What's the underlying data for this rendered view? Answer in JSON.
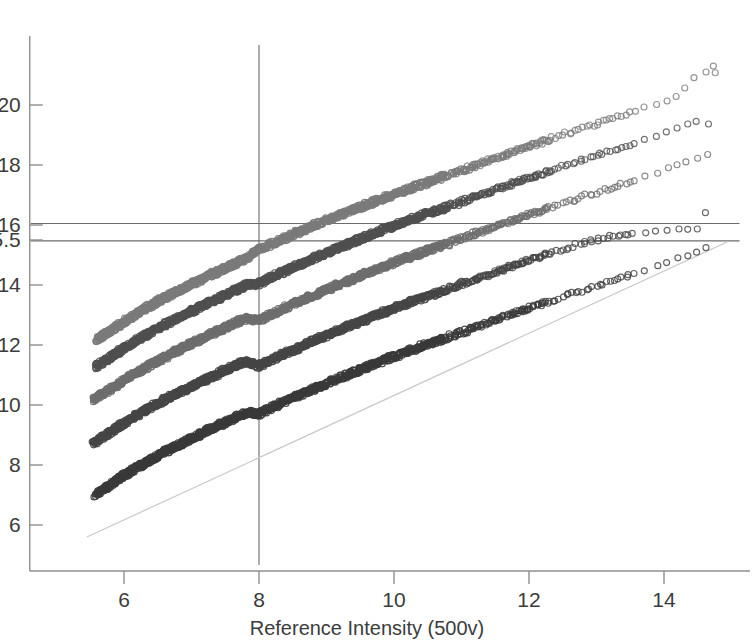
{
  "chart_data": {
    "type": "scatter",
    "title": "",
    "xlabel": "Reference Intensity (500v)",
    "ylabel": "",
    "xlim": [
      5.3,
      15.0
    ],
    "ylim": [
      5.4,
      21.6
    ],
    "xticks": [
      6,
      8,
      10,
      12,
      14
    ],
    "xtick_labels": [
      "6",
      "8",
      "10",
      "12",
      "14"
    ],
    "yticks": [
      6,
      8,
      10,
      12,
      14,
      15.5,
      16,
      18,
      20
    ],
    "ytick_labels": [
      "6",
      "8",
      "10",
      "12",
      "14",
      "15.5",
      "16",
      "18",
      "20"
    ],
    "grid": false,
    "legend": "none",
    "marker": "open-circle",
    "annotations": [
      {
        "name": "hline-16",
        "type": "hline",
        "y": 16.05,
        "color": "#6a6a6a"
      },
      {
        "name": "hline-15_5",
        "type": "hline",
        "y": 15.47,
        "color": "#6a6a6a"
      },
      {
        "name": "vline-8",
        "type": "vline",
        "x": 8.0,
        "color": "#6a6a6a"
      },
      {
        "name": "identity-line",
        "type": "line",
        "x0": 5.45,
        "y0": 5.6,
        "x1": 14.95,
        "y1": 15.45,
        "color": "#c9c9c9"
      }
    ],
    "series": [
      {
        "name": "band-1",
        "color": "#7b7b7b",
        "points": [
          [
            5.6,
            12.18
          ],
          [
            5.75,
            12.4
          ],
          [
            5.9,
            12.62
          ],
          [
            6.05,
            12.85
          ],
          [
            6.2,
            13.06
          ],
          [
            6.35,
            13.26
          ],
          [
            6.5,
            13.45
          ],
          [
            6.65,
            13.63
          ],
          [
            6.8,
            13.8
          ],
          [
            6.95,
            13.97
          ],
          [
            7.1,
            14.14
          ],
          [
            7.25,
            14.3
          ],
          [
            7.4,
            14.46
          ],
          [
            7.55,
            14.62
          ],
          [
            7.7,
            14.78
          ],
          [
            7.85,
            14.95
          ],
          [
            8.0,
            15.18
          ],
          [
            8.2,
            15.38
          ],
          [
            8.4,
            15.58
          ],
          [
            8.6,
            15.78
          ],
          [
            8.8,
            15.97
          ],
          [
            9.0,
            16.15
          ],
          [
            9.2,
            16.33
          ],
          [
            9.4,
            16.51
          ],
          [
            9.6,
            16.68
          ],
          [
            9.8,
            16.85
          ],
          [
            10.0,
            17.02
          ],
          [
            10.25,
            17.22
          ],
          [
            10.5,
            17.42
          ],
          [
            10.75,
            17.62
          ],
          [
            11.0,
            17.82
          ],
          [
            11.25,
            18.02
          ],
          [
            11.5,
            18.22
          ],
          [
            11.75,
            18.42
          ],
          [
            12.0,
            18.62
          ],
          [
            12.3,
            18.85
          ],
          [
            12.6,
            19.08
          ],
          [
            12.9,
            19.3
          ],
          [
            13.2,
            19.52
          ],
          [
            13.55,
            19.78
          ],
          [
            13.9,
            20.05
          ],
          [
            14.2,
            20.28
          ],
          [
            14.45,
            20.9
          ],
          [
            14.75,
            21.3
          ],
          [
            14.8,
            20.8
          ]
        ]
      },
      {
        "name": "band-2",
        "color": "#4f4f4f",
        "points": [
          [
            5.58,
            11.28
          ],
          [
            5.73,
            11.5
          ],
          [
            5.88,
            11.72
          ],
          [
            6.03,
            11.94
          ],
          [
            6.18,
            12.14
          ],
          [
            6.33,
            12.34
          ],
          [
            6.48,
            12.53
          ],
          [
            6.63,
            12.71
          ],
          [
            6.78,
            12.88
          ],
          [
            6.93,
            13.05
          ],
          [
            7.08,
            13.22
          ],
          [
            7.23,
            13.38
          ],
          [
            7.38,
            13.54
          ],
          [
            7.53,
            13.7
          ],
          [
            7.68,
            13.86
          ],
          [
            7.83,
            14.0
          ],
          [
            8.0,
            14.05
          ],
          [
            8.2,
            14.27
          ],
          [
            8.4,
            14.48
          ],
          [
            8.6,
            14.68
          ],
          [
            8.8,
            14.88
          ],
          [
            9.0,
            15.07
          ],
          [
            9.2,
            15.26
          ],
          [
            9.4,
            15.44
          ],
          [
            9.6,
            15.62
          ],
          [
            9.8,
            15.8
          ],
          [
            10.0,
            15.97
          ],
          [
            10.25,
            16.18
          ],
          [
            10.5,
            16.38
          ],
          [
            10.75,
            16.58
          ],
          [
            11.0,
            16.78
          ],
          [
            11.25,
            16.98
          ],
          [
            11.5,
            17.18
          ],
          [
            11.75,
            17.38
          ],
          [
            12.0,
            17.58
          ],
          [
            12.3,
            17.8
          ],
          [
            12.6,
            18.02
          ],
          [
            12.9,
            18.24
          ],
          [
            13.2,
            18.46
          ],
          [
            13.55,
            18.72
          ],
          [
            13.9,
            18.98
          ],
          [
            14.2,
            19.22
          ],
          [
            14.5,
            19.45
          ],
          [
            14.78,
            19.3
          ]
        ]
      },
      {
        "name": "band-3",
        "color": "#6e6e6e",
        "points": [
          [
            5.55,
            10.15
          ],
          [
            5.7,
            10.38
          ],
          [
            5.85,
            10.6
          ],
          [
            6.0,
            10.82
          ],
          [
            6.15,
            11.02
          ],
          [
            6.3,
            11.22
          ],
          [
            6.45,
            11.41
          ],
          [
            6.6,
            11.59
          ],
          [
            6.75,
            11.76
          ],
          [
            6.9,
            11.93
          ],
          [
            7.05,
            12.1
          ],
          [
            7.2,
            12.26
          ],
          [
            7.35,
            12.42
          ],
          [
            7.5,
            12.58
          ],
          [
            7.65,
            12.74
          ],
          [
            7.8,
            12.88
          ],
          [
            8.0,
            12.82
          ],
          [
            8.2,
            13.04
          ],
          [
            8.4,
            13.25
          ],
          [
            8.6,
            13.45
          ],
          [
            8.8,
            13.65
          ],
          [
            9.0,
            13.84
          ],
          [
            9.2,
            14.03
          ],
          [
            9.4,
            14.21
          ],
          [
            9.6,
            14.39
          ],
          [
            9.8,
            14.57
          ],
          [
            10.0,
            14.74
          ],
          [
            10.25,
            14.95
          ],
          [
            10.5,
            15.15
          ],
          [
            10.75,
            15.35
          ],
          [
            11.0,
            15.55
          ],
          [
            11.25,
            15.75
          ],
          [
            11.5,
            15.95
          ],
          [
            11.75,
            16.15
          ],
          [
            12.0,
            16.35
          ],
          [
            12.3,
            16.57
          ],
          [
            12.6,
            16.79
          ],
          [
            12.9,
            17.01
          ],
          [
            13.2,
            17.23
          ],
          [
            13.55,
            17.49
          ],
          [
            13.9,
            17.75
          ],
          [
            14.2,
            18.0
          ],
          [
            14.5,
            18.22
          ],
          [
            14.78,
            18.5
          ]
        ]
      },
      {
        "name": "band-4",
        "color": "#454545",
        "points": [
          [
            5.55,
            8.72
          ],
          [
            5.7,
            8.95
          ],
          [
            5.85,
            9.18
          ],
          [
            6.0,
            9.4
          ],
          [
            6.15,
            9.6
          ],
          [
            6.3,
            9.8
          ],
          [
            6.45,
            9.99
          ],
          [
            6.6,
            10.17
          ],
          [
            6.75,
            10.34
          ],
          [
            6.9,
            10.51
          ],
          [
            7.05,
            10.68
          ],
          [
            7.2,
            10.84
          ],
          [
            7.35,
            11.0
          ],
          [
            7.5,
            11.16
          ],
          [
            7.65,
            11.32
          ],
          [
            7.8,
            11.44
          ],
          [
            8.0,
            11.3
          ],
          [
            8.2,
            11.52
          ],
          [
            8.4,
            11.73
          ],
          [
            8.6,
            11.93
          ],
          [
            8.8,
            12.13
          ],
          [
            9.0,
            12.32
          ],
          [
            9.2,
            12.51
          ],
          [
            9.4,
            12.69
          ],
          [
            9.6,
            12.87
          ],
          [
            9.8,
            13.05
          ],
          [
            10.0,
            13.22
          ],
          [
            10.25,
            13.43
          ],
          [
            10.5,
            13.63
          ],
          [
            10.75,
            13.83
          ],
          [
            11.0,
            14.03
          ],
          [
            11.25,
            14.23
          ],
          [
            11.5,
            14.43
          ],
          [
            11.75,
            14.63
          ],
          [
            12.0,
            14.83
          ],
          [
            12.3,
            15.05
          ],
          [
            12.6,
            15.27
          ],
          [
            12.9,
            15.47
          ],
          [
            13.2,
            15.62
          ],
          [
            13.55,
            15.72
          ],
          [
            13.9,
            15.8
          ],
          [
            14.2,
            15.85
          ],
          [
            14.5,
            15.9
          ],
          [
            14.78,
            16.9
          ]
        ]
      },
      {
        "name": "band-5",
        "color": "#3a3a3a",
        "points": [
          [
            5.58,
            7.02
          ],
          [
            5.73,
            7.25
          ],
          [
            5.88,
            7.48
          ],
          [
            6.03,
            7.7
          ],
          [
            6.18,
            7.9
          ],
          [
            6.33,
            8.1
          ],
          [
            6.48,
            8.29
          ],
          [
            6.63,
            8.47
          ],
          [
            6.78,
            8.64
          ],
          [
            6.93,
            8.81
          ],
          [
            7.08,
            8.98
          ],
          [
            7.23,
            9.14
          ],
          [
            7.38,
            9.3
          ],
          [
            7.53,
            9.46
          ],
          [
            7.68,
            9.62
          ],
          [
            7.83,
            9.75
          ],
          [
            8.0,
            9.7
          ],
          [
            8.2,
            9.92
          ],
          [
            8.4,
            10.13
          ],
          [
            8.6,
            10.33
          ],
          [
            8.8,
            10.53
          ],
          [
            9.0,
            10.72
          ],
          [
            9.2,
            10.91
          ],
          [
            9.4,
            11.09
          ],
          [
            9.6,
            11.27
          ],
          [
            9.8,
            11.45
          ],
          [
            10.0,
            11.62
          ],
          [
            10.25,
            11.83
          ],
          [
            10.5,
            12.03
          ],
          [
            10.75,
            12.23
          ],
          [
            11.0,
            12.43
          ],
          [
            11.25,
            12.63
          ],
          [
            11.5,
            12.83
          ],
          [
            11.75,
            13.03
          ],
          [
            12.0,
            13.23
          ],
          [
            12.3,
            13.45
          ],
          [
            12.6,
            13.67
          ],
          [
            12.9,
            13.89
          ],
          [
            13.2,
            14.11
          ],
          [
            13.55,
            14.37
          ],
          [
            13.9,
            14.63
          ],
          [
            14.2,
            14.88
          ],
          [
            14.5,
            15.1
          ],
          [
            14.78,
            15.4
          ]
        ]
      }
    ]
  }
}
